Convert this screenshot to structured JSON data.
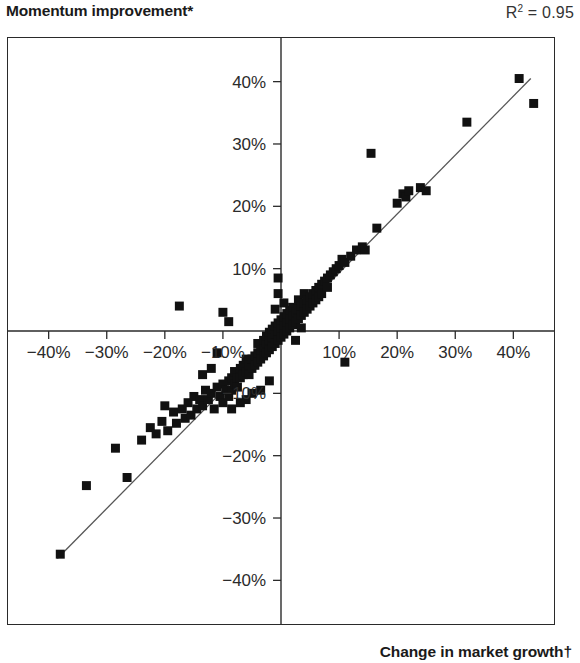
{
  "header": {
    "title": "Momentum improvement*",
    "r2_label": "R² = 0.95",
    "r2_base": "R",
    "r2_sup": "2",
    "r2_value": "= 0.95"
  },
  "axis_title_bottom": "Change in market growth†",
  "colors": {
    "ink": "#1a1a1a",
    "frame": "#2a2a2a",
    "point": "#111111",
    "fit_line": "#555555",
    "background": "#ffffff"
  },
  "chart_data": {
    "type": "scatter",
    "title": "Momentum improvement*",
    "xlabel": "Change in market growth†",
    "ylabel": "Momentum improvement*",
    "annotations": [
      "R² = 0.95"
    ],
    "r_squared": 0.95,
    "grid": false,
    "legend": null,
    "xlim": [
      -47,
      47
    ],
    "ylim": [
      -47,
      47
    ],
    "xticks": [
      -40,
      -30,
      -20,
      -10,
      10,
      20,
      30,
      40
    ],
    "yticks": [
      -40,
      -30,
      -20,
      -10,
      10,
      20,
      30,
      40
    ],
    "xticklabels": [
      "−40%",
      "−30%",
      "−20%",
      "−10%",
      "10%",
      "20%",
      "30%",
      "40%"
    ],
    "yticklabels": [
      "−40%",
      "−30%",
      "−20%",
      "−10%",
      "10%",
      "20%",
      "30%",
      "40%"
    ],
    "fit_line": {
      "x": [
        -38.5,
        43.0
      ],
      "y": [
        -36.5,
        40.5
      ],
      "slope": 0.945,
      "intercept": -0.1
    },
    "points": [
      [
        -38.0,
        -35.8
      ],
      [
        -33.5,
        -24.8
      ],
      [
        -28.5,
        -18.8
      ],
      [
        -26.5,
        -23.5
      ],
      [
        -24.0,
        -17.5
      ],
      [
        -22.5,
        -15.5
      ],
      [
        -21.5,
        -16.5
      ],
      [
        -20.5,
        -14.5
      ],
      [
        -19.5,
        -16.0
      ],
      [
        -18.5,
        -13.0
      ],
      [
        -18.0,
        -14.8
      ],
      [
        -17.0,
        -12.5
      ],
      [
        -16.5,
        -14.0
      ],
      [
        -16.0,
        -11.5
      ],
      [
        -15.5,
        -13.5
      ],
      [
        -15.0,
        -10.5
      ],
      [
        -14.5,
        -12.5
      ],
      [
        -14.0,
        -11.0
      ],
      [
        -13.5,
        -12.0
      ],
      [
        -13.0,
        -9.5
      ],
      [
        -12.5,
        -11.0
      ],
      [
        -12.0,
        -10.0
      ],
      [
        -11.5,
        -12.5
      ],
      [
        -11.0,
        -9.0
      ],
      [
        -10.5,
        -10.5
      ],
      [
        -10.0,
        -8.5
      ],
      [
        -10.0,
        -11.5
      ],
      [
        -9.5,
        -9.5
      ],
      [
        -9.0,
        -8.0
      ],
      [
        -9.0,
        -10.5
      ],
      [
        -8.5,
        -7.5
      ],
      [
        -8.5,
        -9.5
      ],
      [
        -8.0,
        -8.5
      ],
      [
        -8.0,
        -6.5
      ],
      [
        -7.5,
        -7.5
      ],
      [
        -7.5,
        -9.0
      ],
      [
        -7.0,
        -6.0
      ],
      [
        -7.0,
        -7.5
      ],
      [
        -6.5,
        -5.5
      ],
      [
        -6.5,
        -7.0
      ],
      [
        -6.0,
        -6.5
      ],
      [
        -6.0,
        -4.5
      ],
      [
        -5.5,
        -5.5
      ],
      [
        -5.5,
        -7.0
      ],
      [
        -5.0,
        -4.5
      ],
      [
        -5.0,
        -6.0
      ],
      [
        -4.5,
        -4.0
      ],
      [
        -4.5,
        -5.5
      ],
      [
        -4.0,
        -3.5
      ],
      [
        -4.0,
        -5.0
      ],
      [
        -4.0,
        -2.0
      ],
      [
        -3.5,
        -3.0
      ],
      [
        -3.5,
        -4.5
      ],
      [
        -3.0,
        -2.5
      ],
      [
        -3.0,
        -4.0
      ],
      [
        -3.0,
        -1.5
      ],
      [
        -2.5,
        -2.0
      ],
      [
        -2.5,
        -3.5
      ],
      [
        -2.5,
        -0.8
      ],
      [
        -2.0,
        -1.5
      ],
      [
        -2.0,
        -3.0
      ],
      [
        -2.0,
        -0.2
      ],
      [
        -1.5,
        -1.0
      ],
      [
        -1.5,
        -2.5
      ],
      [
        -1.5,
        0.3
      ],
      [
        -1.0,
        -0.5
      ],
      [
        -1.0,
        -2.0
      ],
      [
        -1.0,
        0.8
      ],
      [
        -0.5,
        0.0
      ],
      [
        -0.5,
        -1.5
      ],
      [
        -0.5,
        1.3
      ],
      [
        0.0,
        0.5
      ],
      [
        0.0,
        -1.0
      ],
      [
        0.0,
        1.8
      ],
      [
        0.5,
        1.0
      ],
      [
        0.5,
        -0.5
      ],
      [
        0.5,
        2.3
      ],
      [
        1.0,
        1.5
      ],
      [
        1.0,
        0.0
      ],
      [
        1.0,
        2.8
      ],
      [
        1.5,
        2.0
      ],
      [
        1.5,
        0.5
      ],
      [
        1.5,
        3.3
      ],
      [
        2.0,
        2.5
      ],
      [
        2.0,
        1.0
      ],
      [
        2.0,
        3.8
      ],
      [
        2.5,
        3.0
      ],
      [
        2.5,
        1.5
      ],
      [
        3.0,
        3.5
      ],
      [
        3.0,
        2.0
      ],
      [
        3.0,
        5.0
      ],
      [
        3.5,
        4.0
      ],
      [
        3.5,
        2.5
      ],
      [
        4.0,
        4.5
      ],
      [
        4.0,
        3.0
      ],
      [
        4.0,
        6.0
      ],
      [
        4.5,
        5.0
      ],
      [
        4.5,
        3.5
      ],
      [
        5.0,
        5.5
      ],
      [
        5.0,
        4.0
      ],
      [
        5.5,
        6.0
      ],
      [
        5.5,
        4.5
      ],
      [
        6.0,
        6.5
      ],
      [
        6.0,
        5.0
      ],
      [
        6.5,
        7.0
      ],
      [
        6.5,
        5.5
      ],
      [
        7.0,
        7.5
      ],
      [
        7.0,
        6.0
      ],
      [
        7.5,
        8.0
      ],
      [
        8.0,
        8.5
      ],
      [
        8.0,
        7.0
      ],
      [
        8.5,
        9.0
      ],
      [
        9.0,
        9.5
      ],
      [
        9.5,
        10.0
      ],
      [
        10.0,
        10.5
      ],
      [
        10.5,
        11.5
      ],
      [
        11.0,
        11.0
      ],
      [
        12.0,
        12.0
      ],
      [
        13.0,
        13.0
      ],
      [
        14.0,
        13.5
      ],
      [
        14.5,
        13.0
      ],
      [
        15.5,
        28.5
      ],
      [
        16.5,
        16.5
      ],
      [
        20.0,
        20.5
      ],
      [
        21.0,
        22.0
      ],
      [
        21.5,
        21.5
      ],
      [
        22.0,
        22.5
      ],
      [
        24.0,
        23.0
      ],
      [
        25.0,
        22.5
      ],
      [
        32.0,
        33.5
      ],
      [
        41.0,
        40.5
      ],
      [
        43.5,
        36.5
      ],
      [
        -17.5,
        4.0
      ],
      [
        -10.0,
        3.0
      ],
      [
        -9.0,
        1.5
      ],
      [
        -11.0,
        -3.5
      ],
      [
        -0.5,
        8.5
      ],
      [
        -0.5,
        6.0
      ],
      [
        11.0,
        -5.0
      ],
      [
        -13.5,
        -7.0
      ],
      [
        -12.0,
        -6.0
      ],
      [
        -20.0,
        -12.0
      ],
      [
        -6.0,
        -11.0
      ],
      [
        -5.0,
        -10.0
      ],
      [
        -3.5,
        -9.5
      ],
      [
        -2.0,
        -8.0
      ],
      [
        -8.5,
        -12.5
      ],
      [
        -7.0,
        -11.5
      ],
      [
        2.5,
        -1.5
      ],
      [
        3.5,
        0.5
      ],
      [
        -1.0,
        3.5
      ],
      [
        0.5,
        4.5
      ]
    ]
  }
}
